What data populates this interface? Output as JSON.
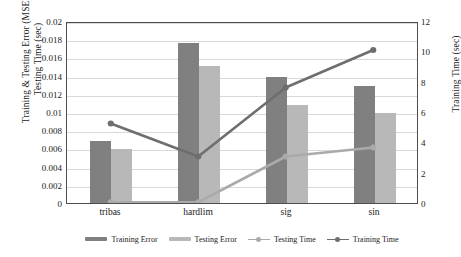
{
  "chart_data": {
    "type": "bar",
    "title": "",
    "categories": [
      "tribas",
      "hardlim",
      "sig",
      "sin"
    ],
    "xlabel": "",
    "ylabel": "Training & Testing Error (MSE), Testing Time (sec)",
    "ylabel_line1": "Training & Testing Error (MSE),",
    "ylabel_line2": "Testing Time (sec)",
    "ylabel_secondary": "Training Time (sec)",
    "ylim": [
      0,
      0.02
    ],
    "ylim_secondary": [
      0,
      12
    ],
    "yticks": [
      "0",
      "0.002",
      "0.004",
      "0.006",
      "0.008",
      "0.01",
      "0.012",
      "0.014",
      "0.016",
      "0.018",
      "0.02"
    ],
    "ytick_values": [
      0,
      0.002,
      0.004,
      0.006,
      0.008,
      0.01,
      0.012,
      0.014,
      0.016,
      0.018,
      0.02
    ],
    "yticks_secondary": [
      "0",
      "2",
      "4",
      "6",
      "8",
      "10",
      "12"
    ],
    "ytick_values_secondary": [
      0,
      2,
      4,
      6,
      8,
      10,
      12
    ],
    "grid": true,
    "legend_position": "bottom",
    "series": [
      {
        "name": "Training Error",
        "kind": "bar",
        "axis": "left",
        "color": "#808080",
        "values": [
          0.0068,
          0.0176,
          0.0138,
          0.0129
        ]
      },
      {
        "name": "Testing  Error",
        "kind": "bar",
        "axis": "left",
        "color": "#b8b8b8",
        "values": [
          0.0059,
          0.0151,
          0.0108,
          0.0099
        ]
      },
      {
        "name": "Testing Time",
        "kind": "line",
        "axis": "right",
        "color": "#aaaaaa",
        "values": [
          0.05,
          0.05,
          3.1,
          3.7
        ]
      },
      {
        "name": "Training Time",
        "kind": "line",
        "axis": "right",
        "color": "#6e6e6e",
        "values": [
          5.3,
          3.1,
          7.7,
          10.2
        ]
      }
    ]
  },
  "colors": {
    "training_error_bar": "#808080",
    "testing_error_bar": "#b8b8b8",
    "testing_time_line": "#aaaaaa",
    "training_time_line": "#6e6e6e",
    "gridline": "#d9d9d9",
    "axis_border": "#4d4d4d",
    "text": "#1a1a1a",
    "background": "#ffffff"
  }
}
